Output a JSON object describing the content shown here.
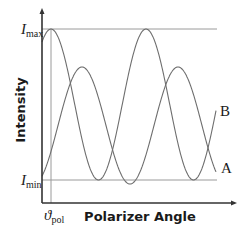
{
  "chart_data": {
    "type": "line",
    "title": "",
    "xlabel": "Polarizer Angle",
    "ylabel": "Intensity",
    "y_ticks": [
      {
        "label": "I",
        "subscript": "max",
        "level": 1.0
      },
      {
        "label": "I",
        "subscript": "min",
        "level": 0.0
      }
    ],
    "x_ticks": [
      {
        "label": "ϑ",
        "subscript": "pol",
        "position": 0.05
      }
    ],
    "grid": false,
    "series": [
      {
        "name": "A",
        "description": "Sinusoid oscillating between Imax and Imin, with maximum at ϑpol",
        "peak_positions_px": [
          51,
          146
        ],
        "trough_positions_px": [
          98,
          194
        ],
        "min": 0.0,
        "max": 1.0
      },
      {
        "name": "B",
        "description": "Sinusoid of smaller amplitude, phase-shifted, maximum below Imax and minimum slightly below Imin",
        "peak_positions_px": [
          82,
          178
        ],
        "trough_positions_px": [
          129
        ],
        "min": -0.03,
        "max": 0.75
      }
    ],
    "reference_lines": [
      {
        "type": "horizontal",
        "label": "Imax"
      },
      {
        "type": "horizontal",
        "label": "Imin"
      },
      {
        "type": "vertical",
        "label": "ϑpol"
      }
    ]
  },
  "labels": {
    "ylabel": "Intensity",
    "xlabel": "Polarizer Angle",
    "imax_main": "I",
    "imax_sub": "max",
    "imin_main": "I",
    "imin_sub": "min",
    "pol_main": "ϑ",
    "pol_sub": "pol",
    "series_a": "A",
    "series_b": "B"
  },
  "colors": {
    "axis": "#333333",
    "curve": "#6e6e6e",
    "reference": "#9a9a9a"
  }
}
